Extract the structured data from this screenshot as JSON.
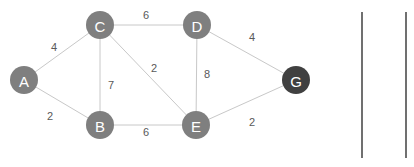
{
  "graph": {
    "nodes": [
      {
        "id": "A",
        "label": "A",
        "x": 24,
        "y": 80,
        "color": "#7f7f7f"
      },
      {
        "id": "C",
        "label": "C",
        "x": 100,
        "y": 25,
        "color": "#7f7f7f"
      },
      {
        "id": "D",
        "label": "D",
        "x": 197,
        "y": 25,
        "color": "#7f7f7f"
      },
      {
        "id": "B",
        "label": "B",
        "x": 100,
        "y": 125,
        "color": "#7f7f7f"
      },
      {
        "id": "E",
        "label": "E",
        "x": 196,
        "y": 125,
        "color": "#7f7f7f"
      },
      {
        "id": "G",
        "label": "G",
        "x": 296,
        "y": 80,
        "color": "#404040"
      }
    ],
    "edges": [
      {
        "from": "A",
        "to": "C",
        "weight": "4",
        "lx": 54,
        "ly": 47
      },
      {
        "from": "A",
        "to": "B",
        "weight": "2",
        "lx": 50,
        "ly": 116
      },
      {
        "from": "C",
        "to": "D",
        "weight": "6",
        "lx": 146,
        "ly": 15
      },
      {
        "from": "C",
        "to": "B",
        "weight": "7",
        "lx": 111,
        "ly": 85
      },
      {
        "from": "C",
        "to": "E",
        "weight": "2",
        "lx": 154,
        "ly": 68
      },
      {
        "from": "D",
        "to": "E",
        "weight": "8",
        "lx": 207,
        "ly": 74
      },
      {
        "from": "B",
        "to": "E",
        "weight": "6",
        "lx": 146,
        "ly": 132
      },
      {
        "from": "D",
        "to": "G",
        "weight": "4",
        "lx": 252,
        "ly": 37
      },
      {
        "from": "E",
        "to": "G",
        "weight": "2",
        "lx": 252,
        "ly": 122
      }
    ]
  },
  "separators": [
    {
      "x": 362,
      "y1": 12,
      "y2": 158
    },
    {
      "x": 406,
      "y1": 12,
      "y2": 158
    }
  ]
}
